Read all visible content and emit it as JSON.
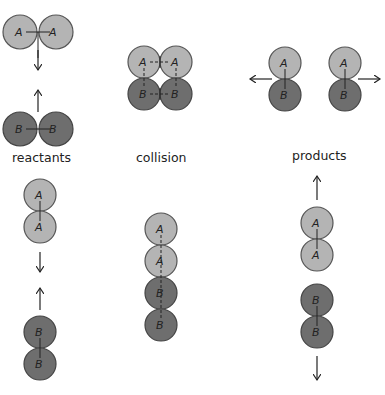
{
  "colors": {
    "atom_a": "#b4b4b4",
    "atom_b": "#6e6e6e",
    "outline": "#444444",
    "arrow": "#222222"
  },
  "labels": {
    "reactants": "reactants",
    "collision": "collision",
    "products": "products"
  },
  "atoms": {
    "a": "A",
    "b": "B"
  }
}
